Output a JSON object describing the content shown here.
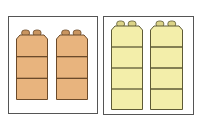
{
  "panels": [
    {
      "name": "orange-panel",
      "frame": {
        "x": 8,
        "y": 16,
        "w": 90,
        "h": 98
      },
      "color": "#e8b47e",
      "stud_color": "#c99560",
      "outline": "#6b4a2a",
      "towers": [
        {
          "x": 16,
          "y": 29,
          "w": 32,
          "h": 71,
          "units": 3
        },
        {
          "x": 56,
          "y": 29,
          "w": 32,
          "h": 71,
          "units": 3
        }
      ]
    },
    {
      "name": "yellow-panel",
      "frame": {
        "x": 103,
        "y": 16,
        "w": 91,
        "h": 99
      },
      "color": "#f3eeaa",
      "stud_color": "#dcd488",
      "outline": "#5e5a35",
      "towers": [
        {
          "x": 111,
          "y": 20,
          "w": 32,
          "h": 90,
          "units": 4
        },
        {
          "x": 150,
          "y": 20,
          "w": 33,
          "h": 90,
          "units": 4
        }
      ]
    }
  ]
}
